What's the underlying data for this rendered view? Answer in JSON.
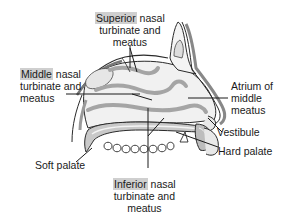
{
  "figure": {
    "highlight_color": "#cfcfcf",
    "line_color": "#1a1a1a",
    "tissue_fill": "#eeeeee",
    "tissue_dark": "#9a9a9a"
  },
  "labels": {
    "superior": {
      "highlight": "Superior",
      "rest": " nasal",
      "line2": "turbinate and",
      "line3": "meatus"
    },
    "middle": {
      "highlight": "Middle",
      "rest": " nasal",
      "line2": "turbinate and",
      "line3": "meatus"
    },
    "atrium": {
      "line1": "Atrium of",
      "line2": "middle",
      "line3": "meatus"
    },
    "vestibule": {
      "line1": "Vestibule"
    },
    "hard_palate": {
      "line1": "Hard palate"
    },
    "soft_palate": {
      "line1": "Soft palate"
    },
    "inferior": {
      "highlight": "Inferior",
      "rest": " nasal",
      "line2": "turbinate and",
      "line3": "meatus"
    }
  }
}
